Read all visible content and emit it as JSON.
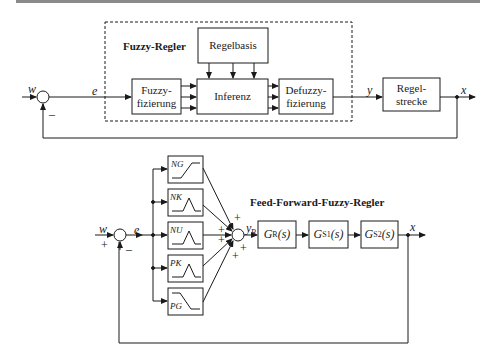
{
  "top_diagram": {
    "title": "Fuzzy-Regler",
    "blocks": {
      "regelbasis": "Regelbasis",
      "fuzzyfizierung_1": "Fuzzy-",
      "fuzzyfizierung_2": "fizierung",
      "inferenz": "Inferenz",
      "defuzzyfizierung_1": "Defuzzy-",
      "defuzzyfizierung_2": "fizierung",
      "regelstrecke_1": "Regel-",
      "regelstrecke_2": "strecke"
    },
    "signals": {
      "w": "w",
      "e": "e",
      "y": "y",
      "x": "x",
      "minus": "–"
    }
  },
  "bottom_diagram": {
    "title": "Feed-Forward-Fuzzy-Regler",
    "membership_functions": [
      {
        "label": "NG",
        "shape": "rising-ramp"
      },
      {
        "label": "NK",
        "shape": "triangle"
      },
      {
        "label": "NU",
        "shape": "triangle"
      },
      {
        "label": "PK",
        "shape": "triangle"
      },
      {
        "label": "PG",
        "shape": "falling-ramp"
      }
    ],
    "signals": {
      "w": "w",
      "e": "e",
      "yR": "y",
      "yR_sub": "R",
      "x": "x",
      "plus": "+",
      "minus": "–"
    },
    "transfer_blocks": [
      {
        "main": "G",
        "sub": "R",
        "arg": "(s)"
      },
      {
        "main": "G",
        "sub": "S1",
        "arg": "(s)"
      },
      {
        "main": "G",
        "sub": "S2",
        "arg": "(s)"
      }
    ]
  }
}
